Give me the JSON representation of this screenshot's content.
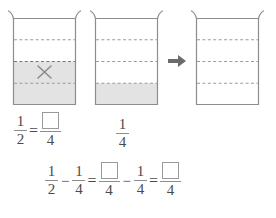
{
  "worksheet": {
    "topic": "fraction-subtraction",
    "beakers": [
      {
        "name": "beaker-one-half",
        "label": "1/2 shaded with X mark",
        "divisions": 4,
        "shaded_from_bottom": 2,
        "marked": true,
        "mark_glyph": "X"
      },
      {
        "name": "beaker-one-quarter",
        "label": "1/4 shaded",
        "divisions": 4,
        "shaded_from_bottom": 1,
        "marked": false,
        "mark_glyph": ""
      },
      {
        "name": "beaker-result-empty",
        "label": "empty result beaker",
        "divisions": 4,
        "shaded_from_bottom": 0,
        "marked": false,
        "mark_glyph": ""
      }
    ],
    "arrow": {
      "name": "right-arrow-icon",
      "direction": "right"
    },
    "row1": {
      "left": {
        "f1_num": "1",
        "f1_den": "2",
        "equals": "=",
        "f2_num": "",
        "f2_den": "4",
        "f2_num_is_box": true
      },
      "right": {
        "f1_num": "1",
        "f1_den": "4"
      }
    },
    "row2": {
      "f1_num": "1",
      "f1_den": "2",
      "minus1": "−",
      "f2_num": "1",
      "f2_den": "4",
      "equals1": "=",
      "f3_num": "",
      "f3_den": "4",
      "minus2": "−",
      "f4_num": "1",
      "f4_den": "4",
      "equals2": "=",
      "f5_num": "",
      "f5_den": "4"
    }
  },
  "colors": {
    "outline": "#8d8d8d",
    "dash": "#9b9b9b",
    "shade_fill": "#e3e3e3",
    "text": "#4a4a4a",
    "arrow": "#6b6b6b",
    "box_border": "#9a9a9a",
    "background": "#ffffff"
  }
}
